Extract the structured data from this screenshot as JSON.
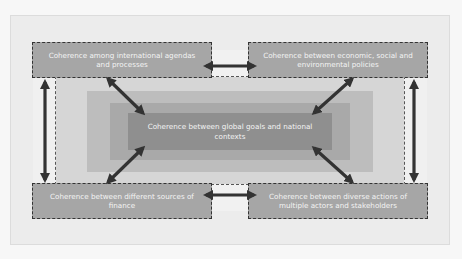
{
  "diagram": {
    "center": {
      "label": "Coherence between global goals and national contexts"
    },
    "boxes": {
      "top_left": {
        "label": "Coherence among international agendas and processes"
      },
      "top_right": {
        "label": "Coherence between economic, social and environmental policies"
      },
      "bottom_left": {
        "label": "Coherence between different sources of finance"
      },
      "bottom_right": {
        "label": "Coherence between diverse actions of multiple actors and stakeholders"
      }
    },
    "connections": [
      {
        "from": "top_left",
        "to": "top_right",
        "type": "double-arrow"
      },
      {
        "from": "bottom_left",
        "to": "bottom_right",
        "type": "double-arrow"
      },
      {
        "from": "top_left",
        "to": "bottom_left",
        "type": "double-arrow"
      },
      {
        "from": "top_right",
        "to": "bottom_right",
        "type": "double-arrow"
      },
      {
        "from": "top_left",
        "to": "center",
        "type": "double-arrow"
      },
      {
        "from": "top_right",
        "to": "center",
        "type": "double-arrow"
      },
      {
        "from": "bottom_left",
        "to": "center",
        "type": "double-arrow"
      },
      {
        "from": "bottom_right",
        "to": "center",
        "type": "double-arrow"
      }
    ],
    "colors": {
      "box_fill": "#a6a6a6",
      "center_fill": "#8f8f8f",
      "ring_outer": "#bdbdbd",
      "ring_middle": "#a9a9a9",
      "arrow": "#333333",
      "text": "#f4f4f4"
    }
  }
}
